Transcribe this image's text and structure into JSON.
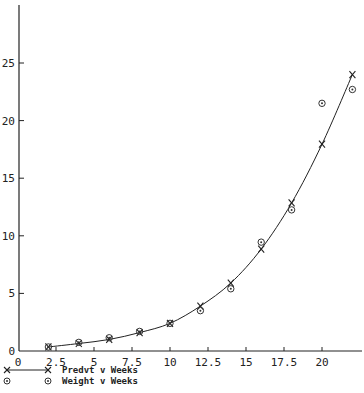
{
  "chart_data": {
    "type": "line",
    "title": "",
    "xlabel": "",
    "ylabel": "",
    "xlim": [
      0,
      22.6
    ],
    "ylim": [
      0,
      30
    ],
    "grid": false,
    "legend_position": "bottom-left",
    "x_ticks": [
      0,
      2.5,
      5,
      7.5,
      10,
      12.5,
      15,
      17.5,
      20
    ],
    "x_tick_labels": [
      "0",
      "2.5",
      "5",
      "7.5",
      "10",
      "12.5",
      "15",
      "17.5",
      "20"
    ],
    "y_ticks": [
      0,
      5,
      10,
      15,
      20,
      25
    ],
    "y_tick_labels": [
      "0",
      "5",
      "10",
      "15",
      "20",
      "25"
    ],
    "x": [
      2,
      4,
      6,
      8,
      10,
      12,
      14,
      16,
      18,
      20,
      22
    ],
    "series": [
      {
        "name": "Predvt v Weeks",
        "marker": "x",
        "line": true,
        "values": [
          0.35,
          0.65,
          1.0,
          1.6,
          2.4,
          3.9,
          5.9,
          8.85,
          12.85,
          17.95,
          24.0
        ]
      },
      {
        "name": "Weight v Weeks",
        "marker": "circle",
        "line": false,
        "values": [
          0.35,
          0.75,
          1.15,
          1.7,
          2.4,
          3.5,
          5.4,
          9.45,
          12.25,
          21.5,
          22.7
        ]
      }
    ]
  },
  "legend": {
    "items": [
      {
        "label": "Predvt v Weeks"
      },
      {
        "label": "Weight v Weeks"
      }
    ]
  },
  "colors": {
    "ink": "#222222",
    "background": "#ffffff"
  }
}
